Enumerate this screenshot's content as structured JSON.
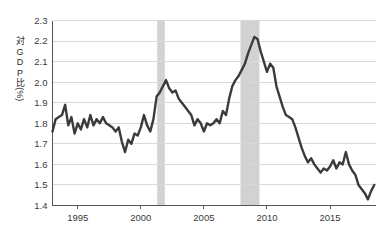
{
  "chart_data": {
    "type": "line",
    "title": "",
    "subtitle": "",
    "xlabel": "",
    "ylabel": "対GDP比(%)",
    "ylabel_chars": [
      "対",
      "G",
      "D",
      "P",
      "比",
      "(%)"
    ],
    "xlim": [
      1993.0,
      2018.6
    ],
    "ylim": [
      1.4,
      2.3
    ],
    "yticks": [
      1.4,
      1.5,
      1.6,
      1.7,
      1.8,
      1.9,
      2.0,
      2.1,
      2.2,
      2.3
    ],
    "ytick_labels": [
      "1.4",
      "1.5",
      "1.6",
      "1.7",
      "1.8",
      "1.9",
      "2.0",
      "2.1",
      "2.2",
      "2.3"
    ],
    "xticks": [
      1995,
      2000,
      2005,
      2010,
      2015
    ],
    "xtick_labels": [
      "1995",
      "2000",
      "2005",
      "2010",
      "2015"
    ],
    "grid": "horizontal",
    "legend": "none",
    "line_color": "#3b3b3b",
    "line_width": 2.4,
    "grid_color": "#d9d9d9",
    "axis_color": "#555555",
    "band_color": "#d2d2d2",
    "background": "#ffffff",
    "shaded_bands": [
      {
        "name": "recession-2001",
        "start": 2001.3,
        "end": 2001.9
      },
      {
        "name": "recession-2008",
        "start": 2007.9,
        "end": 2009.4
      }
    ],
    "series": [
      {
        "name": "対GDP比",
        "x": [
          1993.0,
          1993.25,
          1993.5,
          1993.75,
          1994.0,
          1994.25,
          1994.5,
          1994.75,
          1995.0,
          1995.25,
          1995.5,
          1995.75,
          1996.0,
          1996.25,
          1996.5,
          1996.75,
          1997.0,
          1997.25,
          1997.5,
          1997.75,
          1998.0,
          1998.25,
          1998.5,
          1998.75,
          1999.0,
          1999.25,
          1999.5,
          1999.75,
          2000.0,
          2000.25,
          2000.5,
          2000.75,
          2001.0,
          2001.25,
          2001.5,
          2001.75,
          2002.0,
          2002.25,
          2002.5,
          2002.75,
          2003.0,
          2003.25,
          2003.5,
          2003.75,
          2004.0,
          2004.25,
          2004.5,
          2004.75,
          2005.0,
          2005.25,
          2005.5,
          2005.75,
          2006.0,
          2006.25,
          2006.5,
          2006.75,
          2007.0,
          2007.25,
          2007.5,
          2007.75,
          2008.0,
          2008.25,
          2008.5,
          2008.75,
          2009.0,
          2009.25,
          2009.5,
          2009.75,
          2010.0,
          2010.25,
          2010.5,
          2010.75,
          2011.0,
          2011.25,
          2011.5,
          2011.75,
          2012.0,
          2012.25,
          2012.5,
          2012.75,
          2013.0,
          2013.25,
          2013.5,
          2013.75,
          2014.0,
          2014.25,
          2014.5,
          2014.75,
          2015.0,
          2015.25,
          2015.5,
          2015.75,
          2016.0,
          2016.25,
          2016.5,
          2016.75,
          2017.0,
          2017.25,
          2017.5,
          2017.75,
          2018.0,
          2018.25,
          2018.5
        ],
        "y": [
          1.76,
          1.82,
          1.83,
          1.84,
          1.89,
          1.79,
          1.83,
          1.75,
          1.8,
          1.77,
          1.82,
          1.78,
          1.84,
          1.79,
          1.82,
          1.8,
          1.83,
          1.8,
          1.79,
          1.78,
          1.76,
          1.78,
          1.71,
          1.66,
          1.72,
          1.7,
          1.75,
          1.74,
          1.78,
          1.84,
          1.79,
          1.76,
          1.82,
          1.93,
          1.95,
          1.98,
          2.01,
          1.97,
          1.95,
          1.96,
          1.92,
          1.9,
          1.88,
          1.86,
          1.84,
          1.79,
          1.82,
          1.8,
          1.76,
          1.8,
          1.79,
          1.8,
          1.82,
          1.8,
          1.86,
          1.84,
          1.92,
          1.98,
          2.01,
          2.03,
          2.06,
          2.09,
          2.14,
          2.18,
          2.22,
          2.21,
          2.15,
          2.1,
          2.05,
          2.09,
          2.07,
          1.98,
          1.93,
          1.88,
          1.84,
          1.83,
          1.82,
          1.78,
          1.73,
          1.68,
          1.64,
          1.61,
          1.63,
          1.6,
          1.58,
          1.56,
          1.58,
          1.57,
          1.59,
          1.62,
          1.58,
          1.61,
          1.6,
          1.66,
          1.6,
          1.57,
          1.55,
          1.5,
          1.48,
          1.46,
          1.43,
          1.47,
          1.5
        ]
      }
    ]
  }
}
